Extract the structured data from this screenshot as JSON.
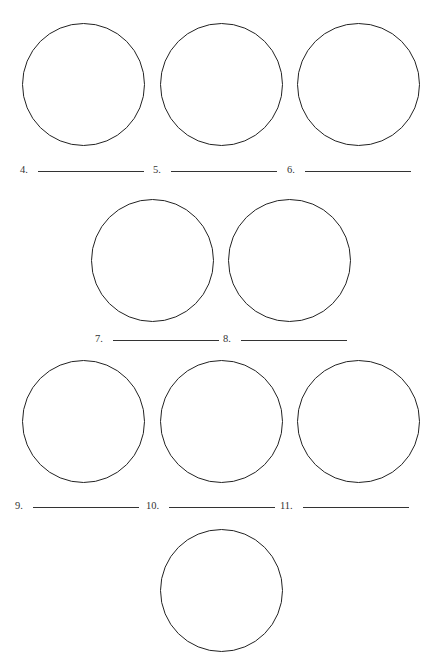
{
  "worksheet": {
    "rows": [
      {
        "circles": [
          {
            "cx": 83,
            "cy": 84
          },
          {
            "cx": 221,
            "cy": 84
          },
          {
            "cx": 358,
            "cy": 84
          }
        ]
      },
      {
        "circles": [
          {
            "cx": 152,
            "cy": 260
          },
          {
            "cx": 289,
            "cy": 260
          }
        ]
      },
      {
        "circles": [
          {
            "cx": 83,
            "cy": 421
          },
          {
            "cx": 221,
            "cy": 421
          },
          {
            "cx": 358,
            "cy": 421
          }
        ]
      },
      {
        "circles": [
          {
            "cx": 221,
            "cy": 590
          }
        ]
      }
    ],
    "answer_labels": [
      {
        "number": "4.",
        "x": 20,
        "y": 164,
        "line_width": 106
      },
      {
        "number": "5.",
        "x": 153,
        "y": 164,
        "line_width": 106
      },
      {
        "number": "6.",
        "x": 287,
        "y": 164,
        "line_width": 106
      },
      {
        "number": "7.",
        "x": 95,
        "y": 333,
        "line_width": 106
      },
      {
        "number": "8.",
        "x": 223,
        "y": 333,
        "line_width": 106
      },
      {
        "number": "9.",
        "x": 15,
        "y": 500,
        "line_width": 106
      },
      {
        "number": "10.",
        "x": 146,
        "y": 500,
        "line_width": 106
      },
      {
        "number": "11.",
        "x": 280,
        "y": 500,
        "line_width": 106
      }
    ]
  }
}
